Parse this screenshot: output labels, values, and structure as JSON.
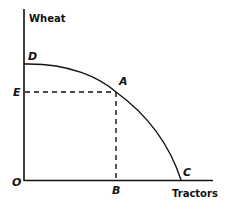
{
  "diagram": {
    "y_axis_label": "Wheat",
    "x_axis_label": "Tractors",
    "origin_label": "O",
    "points": {
      "D": "D",
      "A": "A",
      "C": "C",
      "E": "E",
      "B": "B"
    },
    "colors": {
      "line": "#111111",
      "background": "#ffffff"
    }
  }
}
